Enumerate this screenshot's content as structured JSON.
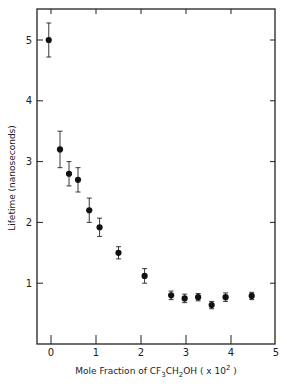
{
  "chart_data": {
    "type": "scatter",
    "title": "",
    "xlabel": "Mole Fraction of CF3CH2OH (x 10^2)",
    "xlabel_parts": {
      "pre": "Mole Fraction of CF",
      "sub1": "3",
      "mid": "CH",
      "sub2": "2",
      "post": "OH ( x 10",
      "sup": "2",
      "end": " )"
    },
    "ylabel": "Lifetime (nanoseconds)",
    "xlim": [
      -0.25,
      5
    ],
    "ylim": [
      0,
      5.5
    ],
    "xticks": [
      "0",
      "1",
      "2",
      "3",
      "4",
      "5"
    ],
    "yticks": [
      "1",
      "2",
      "3",
      "4",
      "5"
    ],
    "grid": false,
    "legend": null,
    "series": [
      {
        "name": "Lifetime",
        "marker": "filled-circle",
        "error_bars": true,
        "x": [
          -0.05,
          0.2,
          0.4,
          0.6,
          0.85,
          1.08,
          1.5,
          2.08,
          2.67,
          2.97,
          3.27,
          3.57,
          3.88,
          4.46
        ],
        "y": [
          5.0,
          3.2,
          2.8,
          2.7,
          2.2,
          1.92,
          1.5,
          1.12,
          0.8,
          0.75,
          0.77,
          0.64,
          0.77,
          0.79
        ],
        "yerr": [
          0.28,
          0.3,
          0.2,
          0.2,
          0.2,
          0.15,
          0.1,
          0.12,
          0.07,
          0.07,
          0.06,
          0.06,
          0.07,
          0.06
        ]
      }
    ]
  }
}
